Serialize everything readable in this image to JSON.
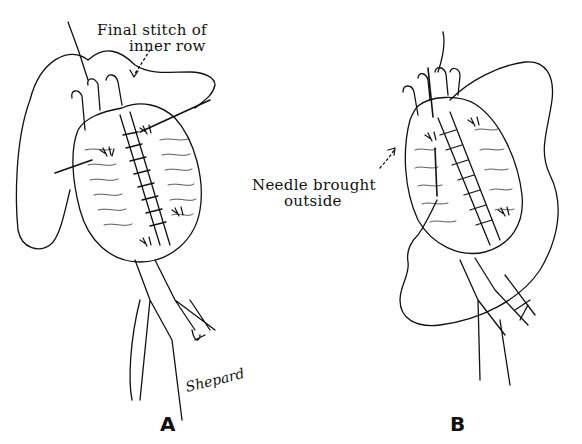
{
  "figure": {
    "panels": [
      {
        "id": "A",
        "letter": "A",
        "annotation_line1": "Final stitch of",
        "annotation_line2": "inner row",
        "signature": "Shepard"
      },
      {
        "id": "B",
        "letter": "B",
        "annotation_line1": "Needle brought",
        "annotation_line2": "outside"
      }
    ],
    "colors": {
      "ink": "#111111",
      "background": "#ffffff"
    }
  }
}
